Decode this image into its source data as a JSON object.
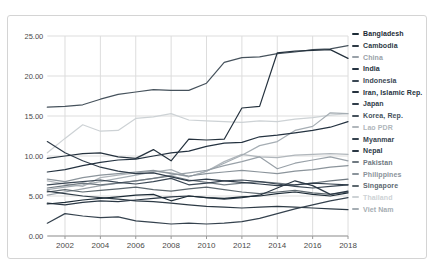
{
  "window": {
    "background": "#ffffff",
    "card_border": "#d4d4d4"
  },
  "chart_data": {
    "type": "line",
    "title": "",
    "xlabel": "",
    "ylabel": "",
    "x": [
      2001,
      2002,
      2003,
      2004,
      2005,
      2006,
      2007,
      2008,
      2009,
      2010,
      2011,
      2012,
      2013,
      2014,
      2015,
      2016,
      2017,
      2018
    ],
    "x_tick_labels": [
      "2002",
      "2004",
      "2006",
      "2008",
      "2010",
      "2012",
      "2014",
      "2016",
      "2018"
    ],
    "y_tick_labels": [
      "0.00",
      "5.00",
      "10.00",
      "15.00",
      "20.00",
      "25.00"
    ],
    "ylim": [
      0,
      25
    ],
    "grid": true,
    "legend_position": "right",
    "axis_text_color": "#4a4a4a",
    "grid_color": "#dddddd",
    "axis_line_color": "#9a9a9a",
    "series": [
      {
        "name": "Bangladesh",
        "color": "#1c2b36",
        "values": [
          4.0,
          4.2,
          4.5,
          4.7,
          4.9,
          5.1,
          5.2,
          4.4,
          5.0,
          4.8,
          4.7,
          4.9,
          5.0,
          5.3,
          5.5,
          5.2,
          5.0,
          5.4
        ]
      },
      {
        "name": "Cambodia",
        "color": "#2d3a45",
        "values": [
          5.6,
          5.3,
          5.0,
          4.8,
          4.6,
          4.4,
          4.3,
          4.1,
          3.9,
          3.7,
          3.6,
          3.5,
          3.6,
          3.7,
          3.6,
          3.5,
          3.4,
          3.3
        ]
      },
      {
        "name": "China",
        "color": "#99a1a8",
        "values": [
          5.1,
          5.5,
          5.9,
          6.3,
          6.6,
          6.9,
          7.2,
          7.6,
          7.9,
          8.2,
          8.8,
          9.3,
          9.9,
          8.4,
          9.1,
          9.5,
          9.9,
          9.4
        ]
      },
      {
        "name": "India",
        "color": "#243240",
        "values": [
          8.0,
          8.3,
          8.8,
          9.2,
          9.5,
          9.6,
          10.0,
          10.4,
          10.6,
          11.2,
          11.6,
          11.7,
          12.4,
          12.6,
          12.9,
          13.2,
          13.6,
          14.3
        ]
      },
      {
        "name": "Indonesia",
        "color": "#3a4754",
        "values": [
          6.4,
          6.6,
          6.8,
          7.0,
          6.7,
          6.5,
          6.8,
          7.2,
          6.4,
          6.6,
          6.9,
          7.0,
          6.8,
          6.5,
          6.2,
          6.0,
          6.2,
          6.4
        ]
      },
      {
        "name": "Iran, Islamic Rep.",
        "color": "#25323e",
        "values": [
          9.7,
          10.0,
          10.3,
          10.4,
          9.9,
          9.7,
          10.8,
          9.4,
          12.1,
          12.0,
          12.1,
          16.0,
          16.2,
          22.9,
          23.1,
          23.2,
          23.3,
          22.2
        ]
      },
      {
        "name": "Japan",
        "color": "#303d4a",
        "values": [
          11.8,
          10.4,
          9.4,
          8.6,
          8.1,
          7.8,
          7.9,
          7.4,
          6.9,
          7.1,
          6.9,
          6.7,
          6.5,
          6.3,
          6.4,
          6.6,
          6.5,
          6.4
        ]
      },
      {
        "name": "Korea, Rep.",
        "color": "#46525c",
        "values": [
          16.1,
          16.2,
          16.4,
          17.1,
          17.7,
          18.0,
          18.3,
          18.2,
          18.2,
          19.1,
          21.7,
          22.3,
          22.4,
          22.8,
          23.0,
          23.3,
          23.4,
          23.8
        ]
      },
      {
        "name": "Lao PDR",
        "color": "#b0b6bb",
        "values": [
          6.9,
          6.5,
          6.2,
          7.3,
          7.6,
          7.9,
          8.1,
          7.9,
          7.4,
          8.1,
          9.3,
          10.2,
          9.9,
          9.8,
          10.1,
          10.2,
          10.3,
          10.2
        ]
      },
      {
        "name": "Myanmar",
        "color": "#35424e",
        "values": [
          1.6,
          2.8,
          2.5,
          2.3,
          2.4,
          1.9,
          1.7,
          1.5,
          1.6,
          1.5,
          1.6,
          1.8,
          2.2,
          2.8,
          3.4,
          3.9,
          4.4,
          4.8
        ]
      },
      {
        "name": "Nepal",
        "color": "#2a3744",
        "values": [
          4.1,
          3.9,
          4.2,
          4.4,
          4.3,
          4.5,
          4.7,
          4.9,
          5.0,
          4.8,
          4.6,
          4.8,
          5.1,
          6.0,
          6.9,
          6.3,
          5.2,
          5.6
        ]
      },
      {
        "name": "Pakistan",
        "color": "#6f7981",
        "values": [
          6.0,
          6.3,
          6.6,
          6.4,
          6.6,
          6.9,
          7.2,
          7.5,
          7.0,
          6.7,
          6.4,
          6.6,
          6.8,
          6.6,
          6.4,
          6.6,
          6.9,
          7.1
        ]
      },
      {
        "name": "Philippines",
        "color": "#8b949b",
        "values": [
          7.1,
          6.8,
          7.3,
          7.6,
          7.8,
          8.0,
          8.2,
          7.8,
          7.5,
          7.8,
          8.0,
          8.2,
          8.0,
          7.8,
          8.1,
          8.3,
          8.6,
          8.8
        ]
      },
      {
        "name": "Singapore",
        "color": "#5d686f",
        "values": [
          5.5,
          5.8,
          5.5,
          5.7,
          5.9,
          6.1,
          5.8,
          5.6,
          5.9,
          6.1,
          5.8,
          5.5,
          5.3,
          5.5,
          5.7,
          5.4,
          5.2,
          5.5
        ]
      },
      {
        "name": "Thailand",
        "color": "#cdd2d5",
        "values": [
          10.4,
          12.2,
          13.9,
          13.1,
          13.2,
          14.7,
          14.9,
          15.3,
          14.5,
          14.4,
          14.3,
          14.2,
          14.4,
          14.3,
          14.6,
          14.8,
          15.1,
          15.3
        ]
      },
      {
        "name": "Viet Nam",
        "color": "#a5adb3",
        "values": [
          5.8,
          6.1,
          6.4,
          6.8,
          7.2,
          7.6,
          8.0,
          8.3,
          7.4,
          8.1,
          9.1,
          10.1,
          11.3,
          11.8,
          13.2,
          13.7,
          15.4,
          15.3
        ]
      }
    ]
  },
  "layout": {
    "plot": {
      "left": 47.3,
      "top": 36,
      "bottom": 236,
      "x_step_per_year": 17.69,
      "px_per_unit": 8
    }
  }
}
